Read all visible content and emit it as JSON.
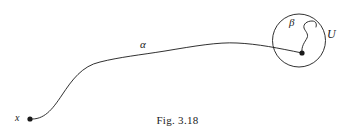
{
  "figure": {
    "caption": "Fig. 3.18",
    "labels": {
      "alpha": "α",
      "beta": "β",
      "neighborhood": "U",
      "basepoint": "x"
    },
    "stroke_color": "#1a1a1a",
    "background_color": "#ffffff"
  },
  "diagram_data": {
    "type": "path-diagram",
    "description": "A long curve alpha starting at point x at lower left and ending at a point inside an open neighborhood U; a short loop-like curve beta drawn inside U starting from that same point.",
    "elements": [
      {
        "name": "basepoint-dot",
        "kind": "point",
        "label": "x",
        "cx": 30,
        "cy": 119,
        "r": 2.6
      },
      {
        "name": "alpha-path",
        "kind": "curve",
        "label": "α",
        "path": "M 30 119 C 44 120 52 110 62 95 C 72 80 82 66 100 62 C 120 57 140 55 165 51 C 195 46 218 42 237 43 C 258 44 278 48 302 53",
        "label_position": {
          "x": 145,
          "y": 45
        }
      },
      {
        "name": "neighborhood-circle",
        "kind": "circle",
        "label": "U",
        "cx": 299,
        "cy": 40.5,
        "r": 26.5,
        "label_position": {
          "x": 331,
          "y": 36
        }
      },
      {
        "name": "endpoint-dot",
        "kind": "point",
        "cx": 302,
        "cy": 53,
        "r": 2.6
      },
      {
        "name": "beta-path",
        "kind": "curve",
        "label": "β",
        "path": "M 302 53 C 301 46 305 42 307 38 C 309 34 305 31 304 28 C 303 24 307 21 312 21 C 316 21 317 24 316 27",
        "label_position": {
          "x": 293,
          "y": 23
        }
      }
    ]
  }
}
